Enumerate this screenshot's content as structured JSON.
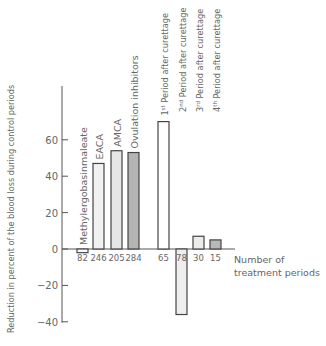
{
  "chart_data": {
    "type": "bar",
    "title": "",
    "xlabel": "Number of treatment periods",
    "xlabel_lines": [
      "Number of",
      "treatment periods"
    ],
    "ylabel": "Reduction in percent of the blood loss during control periods",
    "ylim": [
      -40,
      80
    ],
    "yticks": [
      60,
      40,
      20,
      0,
      -20,
      -40
    ],
    "ytick_labels": [
      "60",
      "40",
      "20",
      "0",
      "−20",
      "−40"
    ],
    "grid": false,
    "legend": null,
    "categories": [
      "Methylergobasinmaleate",
      "EACA",
      "AMCA",
      "Ovulation inhibitors",
      "1st Period after curettage",
      "2nd Period after curettage",
      "3rd Period after curettage",
      "4th Period after curettage"
    ],
    "category_labels": [
      {
        "main": "Methylergobasinmaleate",
        "sup": "",
        "rest": ""
      },
      {
        "main": "EACA",
        "sup": "",
        "rest": ""
      },
      {
        "main": "AMCA",
        "sup": "",
        "rest": ""
      },
      {
        "main": "Ovulation inhibitors",
        "sup": "",
        "rest": ""
      },
      {
        "main": "1",
        "sup": "st",
        "rest": " Period after curettage"
      },
      {
        "main": "2",
        "sup": "nd",
        "rest": " Period after curettage"
      },
      {
        "main": "3",
        "sup": "rd",
        "rest": " Period after curettage"
      },
      {
        "main": "4",
        "sup": "th",
        "rest": " Period after curettage"
      }
    ],
    "values": [
      -2,
      47,
      54,
      53,
      70,
      -36,
      7,
      5
    ],
    "n_treatment_periods": [
      "82",
      "246",
      "205",
      "284",
      "65",
      "78",
      "30",
      "15"
    ],
    "bar_fills": [
      "#ffffff",
      "#f1f1f1",
      "#e6e6e6",
      "#b4b4b4",
      "#ffffff",
      "#eeeeee",
      "#ececec",
      "#b8b8b8"
    ]
  }
}
